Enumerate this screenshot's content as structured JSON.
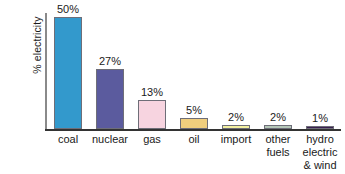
{
  "chart_data": {
    "type": "bar",
    "title": "",
    "subtitle": "",
    "xlabel": "",
    "ylabel": "% electricity in UK",
    "ylabel_lines": [
      "% electricity",
      "in UK"
    ],
    "ylim": [
      0,
      52
    ],
    "grid": false,
    "legend": "none",
    "value_suffix": "%",
    "categories": [
      "coal",
      "nuclear",
      "gas",
      "oil",
      "import",
      "other\nfuels",
      "hydro\nelectric\n& wind"
    ],
    "values": [
      50,
      27,
      13,
      5,
      2,
      2,
      1
    ],
    "value_labels": [
      "50%",
      "27%",
      "13%",
      "5%",
      "2%",
      "2%",
      "1%"
    ],
    "bar_colors": [
      "#3399cc",
      "#5b5b9e",
      "#f7d4e0",
      "#f0ce7d",
      "#f2f0a0",
      "#b5c7b8",
      "#3a2050"
    ],
    "bar_outline_color": "#6e6e78",
    "axis_color": "#333333",
    "y_axis_color": "#8a8a8a",
    "background_color": "#ffffff",
    "text_color": "#1a1a1a"
  }
}
